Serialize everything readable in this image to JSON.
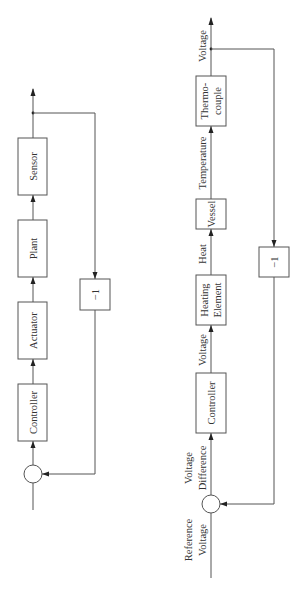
{
  "diagrams": {
    "generic": {
      "blocks": [
        {
          "id": "sensor",
          "label": "Sensor"
        },
        {
          "id": "plant",
          "label": "Plant"
        },
        {
          "id": "actuator",
          "label": "Actuator"
        },
        {
          "id": "controller",
          "label": "Controller"
        }
      ],
      "feedback_gain": "−1"
    },
    "heating": {
      "blocks": [
        {
          "id": "thermocouple",
          "label_line1": "Thermo-",
          "label_line2": "couple"
        },
        {
          "id": "vessel",
          "label": "Vessel"
        },
        {
          "id": "heating-element",
          "label_line1": "Heating",
          "label_line2": "Element"
        },
        {
          "id": "controller",
          "label": "Controller"
        }
      ],
      "signals": {
        "output": "Voltage",
        "temperature": "Temperature",
        "heat": "Heat",
        "controller_output": "Voltage",
        "error_line1": "Voltage",
        "error_line2": "Difference",
        "reference_line1": "Reference",
        "reference_line2": "Voltage"
      },
      "feedback_gain": "−1"
    }
  },
  "colors": {
    "line": "#555555",
    "text": "#333333",
    "background": "#ffffff"
  }
}
